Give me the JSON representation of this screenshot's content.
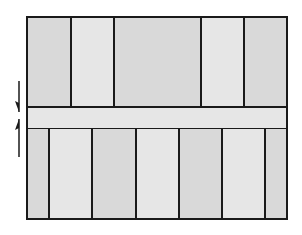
{
  "diagram": {
    "colors": {
      "fill_dark": "#d9d9d9",
      "fill_light": "#e6e6e6",
      "stroke": "#1a1a1a",
      "background": "#ffffff"
    },
    "box": {
      "x": 27,
      "y": 17,
      "width": 260,
      "height": 202
    },
    "top_row": {
      "y": 17,
      "height": 90,
      "dividers_x": [
        71,
        114,
        201,
        244
      ]
    },
    "band": {
      "y": 107,
      "height": 22
    },
    "bottom_row": {
      "y": 129,
      "height": 90,
      "dividers_x": [
        49,
        92,
        136,
        179,
        222,
        265
      ]
    },
    "arrows": [
      {
        "name": "down-arrow",
        "x": 19,
        "y1": 81,
        "y2": 112,
        "direction": "down"
      },
      {
        "name": "up-arrow",
        "x": 19,
        "y1": 157,
        "y2": 119,
        "direction": "up"
      }
    ]
  }
}
